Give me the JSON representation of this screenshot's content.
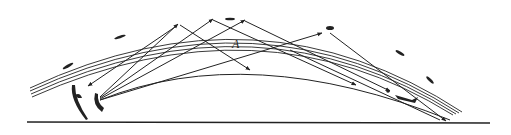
{
  "diagram": {
    "labels": {
      "region_a": "A"
    },
    "colors": {
      "line": "#222222",
      "background": "#ffffff"
    },
    "elements": {
      "ground": "ground-line",
      "ionosphere": "layered-ionosphere-arc",
      "transmitter": "antenna-transmitter",
      "receiver_left": "antenna-receiver",
      "rays": [
        "ray-1",
        "ray-2",
        "ray-3",
        "ray-4",
        "ray-5",
        "ground-wave"
      ]
    }
  }
}
